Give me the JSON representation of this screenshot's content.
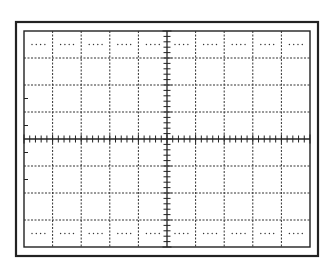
{
  "diagram": {
    "type": "oscilloscope-graticule",
    "colors": {
      "background": "#ffffff",
      "line": "#333333",
      "frame": "#222222"
    },
    "outer_frame": {
      "x": 16,
      "y": 22,
      "w": 302,
      "h": 234
    },
    "graticule": {
      "x": 24,
      "y": 31,
      "w": 286,
      "h": 216,
      "horizontal_divisions": 10,
      "vertical_divisions": 8,
      "minor_ticks_per_division": 5,
      "dotted_rows_fraction": [
        0.5,
        7.5
      ],
      "left_edge_ticks_divisions": [
        2.5,
        3.5,
        4.5,
        5.5
      ]
    }
  }
}
